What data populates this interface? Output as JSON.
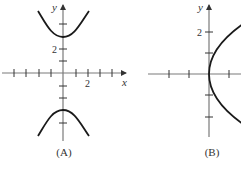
{
  "figures": [
    {
      "caption": "(A)",
      "x_axis_label": "x",
      "y_axis_label": "y",
      "x_tick_label": "2",
      "y_tick_label": "2",
      "description": "Hyperbola opening up and down, vertices at (0, 3) and (0, -3)",
      "curve_type": "hyperbola-vertical",
      "vertices": [
        [
          0,
          3
        ],
        [
          0,
          -3
        ]
      ]
    },
    {
      "caption": "(B)",
      "y_axis_label": "y",
      "y_tick_label": "2",
      "description": "Parabola opening to the right with vertex at the origin",
      "curve_type": "parabola-right",
      "vertex": [
        0,
        0
      ]
    }
  ]
}
